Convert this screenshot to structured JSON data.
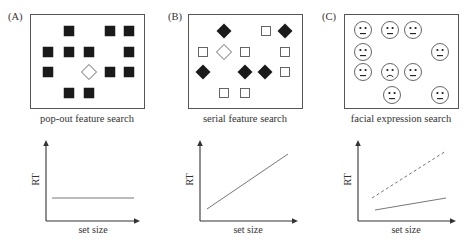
{
  "colors": {
    "stroke": "#555555",
    "fill": "#1a1a1a",
    "text": "#333333",
    "line": "#777777"
  },
  "panels": [
    {
      "letter": "(A)",
      "caption": "pop-out feature search",
      "box": {
        "x": 30,
        "y": 14,
        "w": 114,
        "h": 94
      },
      "items": [
        {
          "type": "filled-square",
          "x": 69,
          "y": 31
        },
        {
          "type": "filled-square",
          "x": 110,
          "y": 31
        },
        {
          "type": "filled-square",
          "x": 129,
          "y": 31
        },
        {
          "type": "filled-square",
          "x": 48,
          "y": 52
        },
        {
          "type": "filled-square",
          "x": 69,
          "y": 52
        },
        {
          "type": "filled-square",
          "x": 89,
          "y": 52
        },
        {
          "type": "filled-square",
          "x": 129,
          "y": 52
        },
        {
          "type": "filled-square",
          "x": 48,
          "y": 72
        },
        {
          "type": "open-diamond",
          "x": 89,
          "y": 72
        },
        {
          "type": "filled-square",
          "x": 110,
          "y": 72
        },
        {
          "type": "filled-square",
          "x": 129,
          "y": 72
        },
        {
          "type": "filled-square",
          "x": 69,
          "y": 93
        },
        {
          "type": "filled-square",
          "x": 89,
          "y": 93
        }
      ]
    },
    {
      "letter": "(B)",
      "caption": "serial feature search",
      "box": {
        "x": 188,
        "y": 14,
        "w": 114,
        "h": 94
      },
      "items": [
        {
          "type": "filled-diamond",
          "x": 224,
          "y": 31
        },
        {
          "type": "open-square",
          "x": 266,
          "y": 31
        },
        {
          "type": "filled-diamond",
          "x": 285,
          "y": 31
        },
        {
          "type": "open-square",
          "x": 203,
          "y": 52
        },
        {
          "type": "open-diamond",
          "x": 224,
          "y": 52
        },
        {
          "type": "open-square",
          "x": 245,
          "y": 52
        },
        {
          "type": "open-square",
          "x": 285,
          "y": 52
        },
        {
          "type": "filled-diamond",
          "x": 203,
          "y": 72
        },
        {
          "type": "filled-diamond",
          "x": 245,
          "y": 72
        },
        {
          "type": "filled-diamond",
          "x": 265,
          "y": 72
        },
        {
          "type": "open-square",
          "x": 285,
          "y": 72
        },
        {
          "type": "open-square",
          "x": 224,
          "y": 93
        },
        {
          "type": "open-square",
          "x": 245,
          "y": 93
        }
      ]
    },
    {
      "letter": "(C)",
      "caption": "facial expression search",
      "box": {
        "x": 344,
        "y": 14,
        "w": 114,
        "h": 94
      },
      "items": [
        {
          "type": "neutral-face",
          "x": 363,
          "y": 30
        },
        {
          "type": "neutral-face",
          "x": 390,
          "y": 30
        },
        {
          "type": "neutral-face",
          "x": 413,
          "y": 30
        },
        {
          "type": "neutral-face",
          "x": 363,
          "y": 52
        },
        {
          "type": "neutral-face",
          "x": 440,
          "y": 52
        },
        {
          "type": "neutral-face",
          "x": 363,
          "y": 72
        },
        {
          "type": "sad-face",
          "x": 390,
          "y": 72
        },
        {
          "type": "neutral-face",
          "x": 413,
          "y": 72
        },
        {
          "type": "neutral-face",
          "x": 392,
          "y": 95
        },
        {
          "type": "neutral-face",
          "x": 440,
          "y": 95
        }
      ]
    }
  ],
  "chart_data": [
    {
      "type": "line",
      "title": "pop-out feature search",
      "xlabel": "set size",
      "ylabel": "RT",
      "grid": false,
      "axes": {
        "origin": [
          46,
          221
        ],
        "x_end": 140,
        "y_end": 140
      },
      "series": [
        {
          "name": "target",
          "style": "solid",
          "points": [
            [
              52,
              198
            ],
            [
              134,
              198
            ]
          ]
        }
      ]
    },
    {
      "type": "line",
      "title": "serial feature search",
      "xlabel": "set size",
      "ylabel": "RT",
      "grid": false,
      "axes": {
        "origin": [
          200,
          221
        ],
        "x_end": 298,
        "y_end": 140
      },
      "series": [
        {
          "name": "target",
          "style": "solid",
          "points": [
            [
              207,
              209
            ],
            [
              288,
              154
            ]
          ]
        }
      ]
    },
    {
      "type": "line",
      "title": "facial expression search",
      "xlabel": "set size",
      "ylabel": "RT",
      "grid": false,
      "axes": {
        "origin": [
          358,
          221
        ],
        "x_end": 456,
        "y_end": 140
      },
      "series": [
        {
          "name": "dashed",
          "style": "dashed",
          "points": [
            [
              372,
              198
            ],
            [
              446,
              151
            ]
          ]
        },
        {
          "name": "solid",
          "style": "solid",
          "points": [
            [
              375,
              210
            ],
            [
              446,
              198
            ]
          ]
        }
      ]
    }
  ]
}
